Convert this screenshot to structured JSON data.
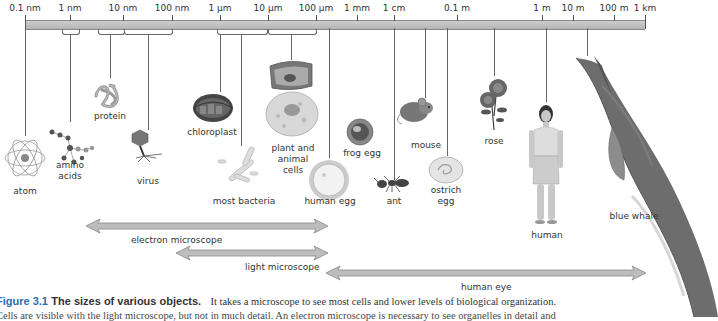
{
  "scale": {
    "ticks": [
      {
        "label": "0.1 nm",
        "x": 25
      },
      {
        "label": "1 nm",
        "x": 70
      },
      {
        "label": "10 nm",
        "x": 123
      },
      {
        "label": "100 nm",
        "x": 172
      },
      {
        "label": "1 µm",
        "x": 220
      },
      {
        "label": "10 µm",
        "x": 268
      },
      {
        "label": "100 µm",
        "x": 316
      },
      {
        "label": "1 mm",
        "x": 357
      },
      {
        "label": "1 cm",
        "x": 394
      },
      {
        "label": "0.1 m",
        "x": 457
      },
      {
        "label": "1 m",
        "x": 542
      },
      {
        "label": "10 m",
        "x": 573
      },
      {
        "label": "100 m",
        "x": 614
      },
      {
        "label": "1 km",
        "x": 645
      }
    ]
  },
  "objects": [
    {
      "name": "atom",
      "label": "atom"
    },
    {
      "name": "amino-acids",
      "label_line1": "amino",
      "label_line2": "acids"
    },
    {
      "name": "protein",
      "label": "protein"
    },
    {
      "name": "virus",
      "label": "virus"
    },
    {
      "name": "chloroplast",
      "label": "chloroplast"
    },
    {
      "name": "most-bacteria",
      "label": "most bacteria"
    },
    {
      "name": "plant-and-animal-cells",
      "label_line1": "plant and",
      "label_line2": "animal",
      "label_line3": "cells"
    },
    {
      "name": "human-egg",
      "label": "human egg"
    },
    {
      "name": "frog-egg",
      "label": "frog egg"
    },
    {
      "name": "ant",
      "label": "ant"
    },
    {
      "name": "mouse",
      "label": "mouse"
    },
    {
      "name": "ostrich-egg",
      "label_line1": "ostrich",
      "label_line2": "egg"
    },
    {
      "name": "rose",
      "label": "rose"
    },
    {
      "name": "human",
      "label": "human"
    },
    {
      "name": "blue-whale",
      "label": "blue whale"
    }
  ],
  "ranges": [
    {
      "name": "electron-microscope",
      "label": "electron microscope"
    },
    {
      "name": "light-microscope",
      "label": "light microscope"
    },
    {
      "name": "human-eye",
      "label": "human eye"
    }
  ],
  "caption": {
    "figure_number": "Figure 3.1",
    "title": "The sizes of various objects.",
    "body": "It takes a microscope to see most cells and lower levels of biological organization.",
    "body_line2": "Cells are visible with the light microscope, but not in much detail. An electron microscope is necessary to see organelles in detail and"
  }
}
